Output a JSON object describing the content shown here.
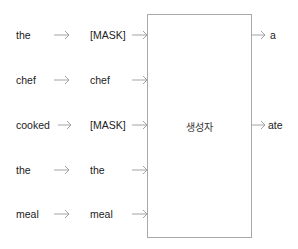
{
  "diagram": {
    "input_tokens": [
      "the",
      "chef",
      "cooked",
      "the",
      "meal"
    ],
    "masked_tokens": [
      "[MASK]",
      "chef",
      "[MASK]",
      "the",
      "meal"
    ],
    "generator": {
      "label": "생성자"
    },
    "outputs": [
      {
        "row": 0,
        "label": "a"
      },
      {
        "row": 2,
        "label": "ate"
      }
    ],
    "arrow_icon": "long-right-arrow",
    "colors": {
      "arrow": "#9a9a9a",
      "box_border": "#a8a8a8",
      "text": "#222222"
    }
  }
}
